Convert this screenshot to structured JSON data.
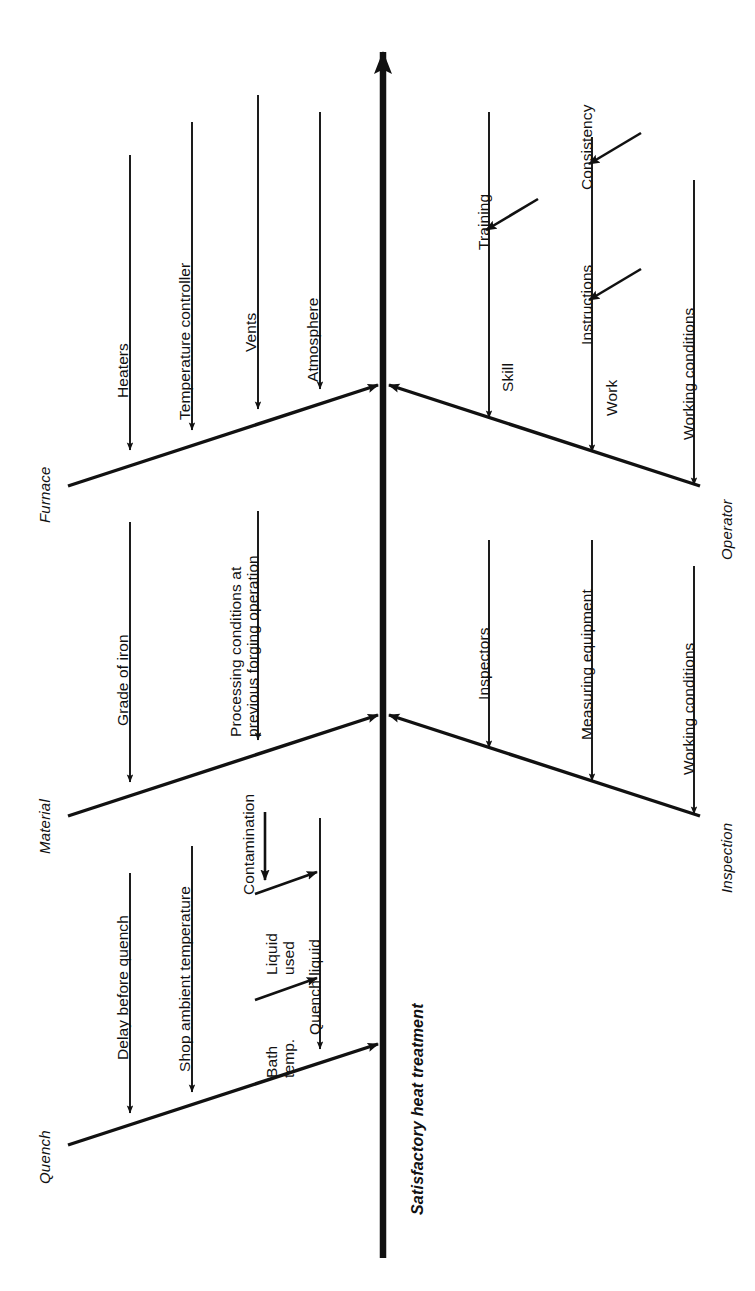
{
  "diagram": {
    "type": "fishbone-ishikawa",
    "orientation": "rotated-90-counterclockwise",
    "effect": "Satisfactory heat treatment",
    "stroke_color": "#111111",
    "background_color": "#ffffff",
    "categories": [
      {
        "name": "Furnace",
        "side": "left",
        "causes": [
          {
            "label": "Heaters"
          },
          {
            "label": "Temperature controller"
          },
          {
            "label": "Vents"
          },
          {
            "label": "Atmosphere"
          }
        ]
      },
      {
        "name": "Material",
        "side": "left",
        "causes": [
          {
            "label": "Grade of iron"
          },
          {
            "label": "Processing conditions at",
            "label2": "previous forging operation"
          }
        ]
      },
      {
        "name": "Quench",
        "side": "left",
        "causes": [
          {
            "label": "Delay before quench"
          },
          {
            "label": "Shop ambient temperature"
          },
          {
            "label": "Quench liquid"
          }
        ],
        "sub_causes": [
          {
            "label": "Liquid",
            "label2": "used",
            "parent": "Quench liquid"
          },
          {
            "label": "Bath",
            "label2": "temp.",
            "parent": "Quench liquid"
          },
          {
            "label": "Contamination",
            "parent": "Liquid used"
          }
        ]
      },
      {
        "name": "Operator",
        "side": "right",
        "causes": [
          {
            "label": "Skill"
          },
          {
            "label": "Work"
          },
          {
            "label": "Working conditions"
          }
        ],
        "sub_causes": [
          {
            "label": "Training",
            "parent": "Skill"
          },
          {
            "label": "Instructions",
            "parent": "Work"
          },
          {
            "label": "Consistency",
            "parent": "Work"
          }
        ]
      },
      {
        "name": "Inspection",
        "side": "right",
        "causes": [
          {
            "label": "Inspectors"
          },
          {
            "label": "Measuring equipment"
          },
          {
            "label": "Working conditions"
          }
        ]
      }
    ]
  },
  "labels": {
    "spine": "Satisfactory heat treatment",
    "cat_furnace": "Furnace",
    "cat_material": "Material",
    "cat_quench": "Quench",
    "cat_operator": "Operator",
    "cat_inspection": "Inspection",
    "heaters": "Heaters",
    "temperature_controller": "Temperature controller",
    "vents": "Vents",
    "atmosphere": "Atmosphere",
    "grade_of_iron": "Grade of iron",
    "processing_conditions_1": "Processing conditions at",
    "processing_conditions_2": "previous forging operation",
    "delay_before_quench": "Delay before quench",
    "shop_ambient_temperature": "Shop ambient temperature",
    "quench_liquid": "Quench liquid",
    "liquid_used_1": "Liquid",
    "liquid_used_2": "used",
    "bath_temp_1": "Bath",
    "bath_temp_2": "temp.",
    "contamination": "Contamination",
    "training": "Training",
    "skill": "Skill",
    "instructions": "Instructions",
    "consistency": "Consistency",
    "work": "Work",
    "working_conditions_operator": "Working conditions",
    "inspectors": "Inspectors",
    "measuring_equipment": "Measuring equipment",
    "working_conditions_inspection": "Working conditions"
  }
}
